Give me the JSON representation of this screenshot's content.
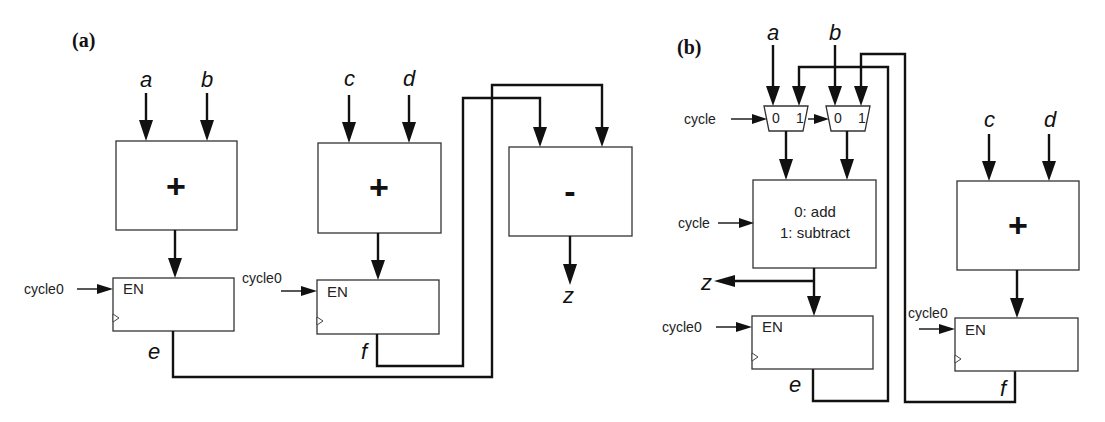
{
  "panels": {
    "a": {
      "label": "(a)",
      "inputs": {
        "a": "a",
        "b": "b",
        "c": "c",
        "d": "d"
      },
      "adder1": {
        "op": "+"
      },
      "adder2": {
        "op": "+"
      },
      "subtractor": {
        "op": "-"
      },
      "reg_e": {
        "enable_label": "EN",
        "enable_signal": "cycle0",
        "output": "e"
      },
      "reg_f": {
        "enable_label": "EN",
        "enable_signal": "cycle0",
        "output": "f"
      },
      "output": "z"
    },
    "b": {
      "label": "(b)",
      "inputs": {
        "a": "a",
        "b": "b",
        "c": "c",
        "d": "d"
      },
      "mux1": {
        "in0": "0",
        "in1": "1"
      },
      "mux2": {
        "in0": "0",
        "in1": "1"
      },
      "mux_select": "cycle",
      "alu": {
        "line1": "0: add",
        "line2": "1: subtract",
        "control": "cycle"
      },
      "adder": {
        "op": "+"
      },
      "reg_e": {
        "enable_label": "EN",
        "enable_signal": "cycle0",
        "output": "e"
      },
      "reg_f": {
        "enable_label": "EN",
        "enable_signal": "cycle0",
        "output": "f"
      },
      "output": "z"
    }
  }
}
